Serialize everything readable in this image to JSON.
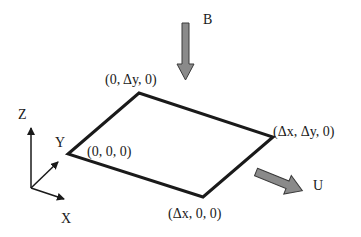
{
  "diagram": {
    "type": "3d-plate-schematic",
    "plate": {
      "vertices": [
        {
          "id": "origin",
          "label": "(0, 0, 0)"
        },
        {
          "id": "y-corner",
          "label": "(0, Δy, 0)"
        },
        {
          "id": "xy-corner",
          "label": "(Δx, Δy, 0)"
        },
        {
          "id": "x-corner",
          "label": "(Δx, 0, 0)"
        }
      ],
      "edge_color": "#1a1a1a"
    },
    "axes": {
      "z_label": "Z",
      "y_label": "Y",
      "x_label": "X"
    },
    "arrows": {
      "b": {
        "label": "B",
        "direction": "down",
        "color": "#8a8a8a"
      },
      "u": {
        "label": "U",
        "direction": "down-right",
        "color": "#8a8a8a"
      }
    }
  }
}
